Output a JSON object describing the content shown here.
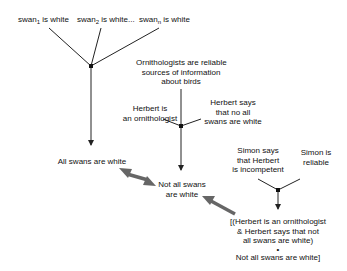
{
  "premises_top": [
    {
      "base": "swan",
      "sub": "1",
      "rest": " is white"
    },
    {
      "base": "swan",
      "sub": "2",
      "rest": " is white"
    },
    {
      "ellipsis": "..."
    },
    {
      "base": "swan",
      "sub": "n",
      "rest": " is white"
    }
  ],
  "nodes": {
    "ornithologists": [
      "Ornithologists are reliable",
      "sources of information",
      "about birds"
    ],
    "herbert_is": [
      "Herbert is",
      "an ornithologist"
    ],
    "herbert_says": [
      "Herbert says",
      "that no all",
      "swans are white"
    ],
    "all_swans": [
      "All swans are white"
    ],
    "not_all_swans": [
      "Not all swans",
      "are white"
    ],
    "simon_says": [
      "Simon says",
      "that Herbert",
      "is incompetent"
    ],
    "simon_reliable": [
      "Simon is",
      "reliable"
    ],
    "undercutter": [
      "[(Herbert is an ornithologist",
      "& Herbert says that not",
      "all swans are white)",
      "•",
      "Not all swans are white]"
    ]
  },
  "colors": {
    "line": "#222222",
    "attack_arrow": "#666666"
  }
}
